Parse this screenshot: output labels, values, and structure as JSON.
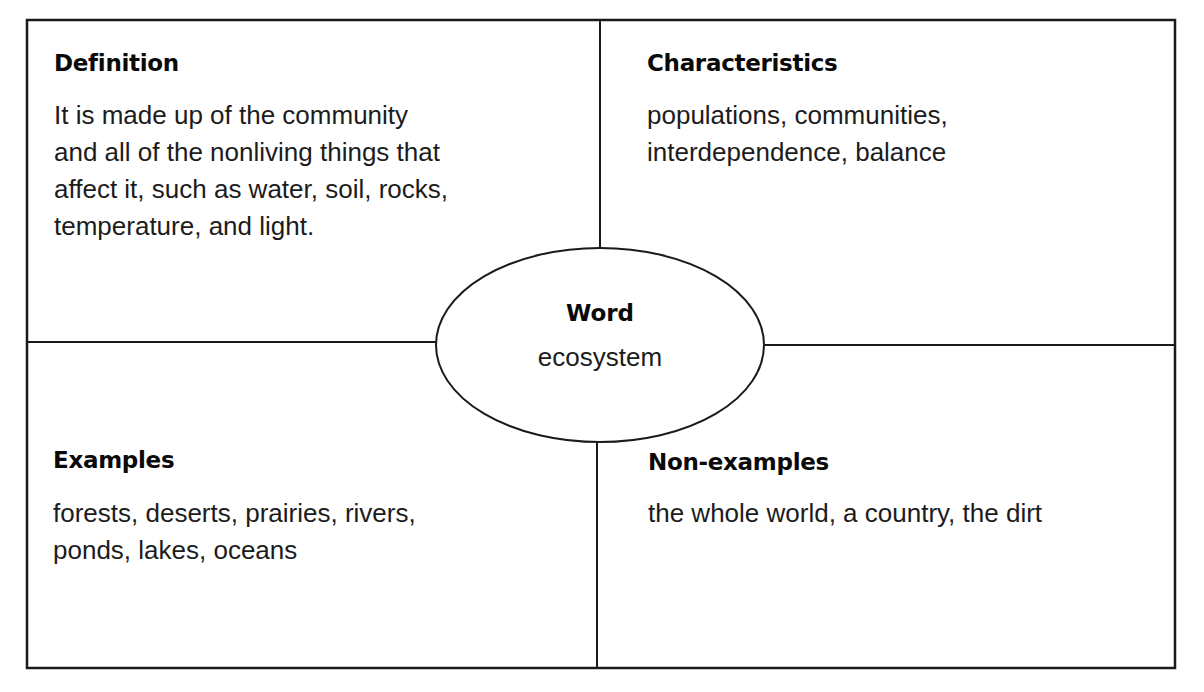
{
  "diagram": {
    "type": "Frayer model",
    "center": {
      "title": "Word",
      "value": "ecosystem"
    },
    "quadrants": {
      "definition": {
        "title": "Definition",
        "lines": [
          "It is made up of the community",
          "and all of the nonliving things that",
          "affect it, such as water, soil, rocks,",
          "temperature, and light."
        ]
      },
      "characteristics": {
        "title": "Characteristics",
        "lines": [
          "populations, communities,",
          "interdependence, balance"
        ]
      },
      "examples": {
        "title": "Examples",
        "lines": [
          "forests, deserts, prairies, rivers,",
          "ponds, lakes, oceans"
        ]
      },
      "non_examples": {
        "title": "Non-examples",
        "lines": [
          "the whole world, a country, the dirt"
        ]
      }
    },
    "colors": {
      "line": "#1a1a1a",
      "background": "#ffffff",
      "text": "#1c1c1c"
    }
  }
}
